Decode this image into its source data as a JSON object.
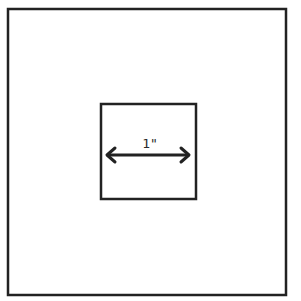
{
  "diagram": {
    "outer_square": {
      "x": 8,
      "y": 9,
      "width": 278,
      "height": 286
    },
    "inner_square": {
      "x": 101,
      "y": 104,
      "width": 95,
      "height": 95
    },
    "dimension": {
      "label": "1\"",
      "x1": 106,
      "x2": 190,
      "y": 155
    },
    "colors": {
      "stroke": "#222222",
      "background": "#ffffff"
    }
  }
}
